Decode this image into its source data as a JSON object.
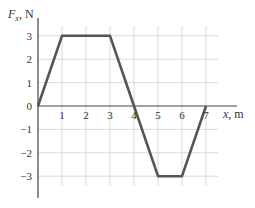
{
  "chart_data": {
    "type": "line",
    "title": "",
    "xlabel_var": "x",
    "xlabel_unit": ", m",
    "ylabel_var": "F",
    "ylabel_sub": "x",
    "ylabel_unit": ", N",
    "x": [
      0,
      1,
      3,
      4,
      5,
      6,
      7
    ],
    "values": [
      0,
      3,
      3,
      0,
      -3,
      -3,
      0
    ],
    "xticks": [
      1,
      2,
      3,
      4,
      5,
      6,
      7
    ],
    "xtick_labels": [
      "1",
      "2",
      "3",
      "4",
      "5",
      "6",
      "7"
    ],
    "yticks": [
      3,
      2,
      1,
      0,
      -1,
      -2,
      -3
    ],
    "ytick_labels": [
      "3",
      "2",
      "1",
      "0",
      "−1",
      "−2",
      "−3"
    ],
    "xlim": [
      0,
      7.5
    ],
    "ylim": [
      -3.8,
      3.7
    ],
    "grid": true,
    "legend": null,
    "colors": {
      "line": "#555555",
      "grid": "#d9d9d9",
      "axis": "#444444",
      "text": "#333333"
    }
  }
}
